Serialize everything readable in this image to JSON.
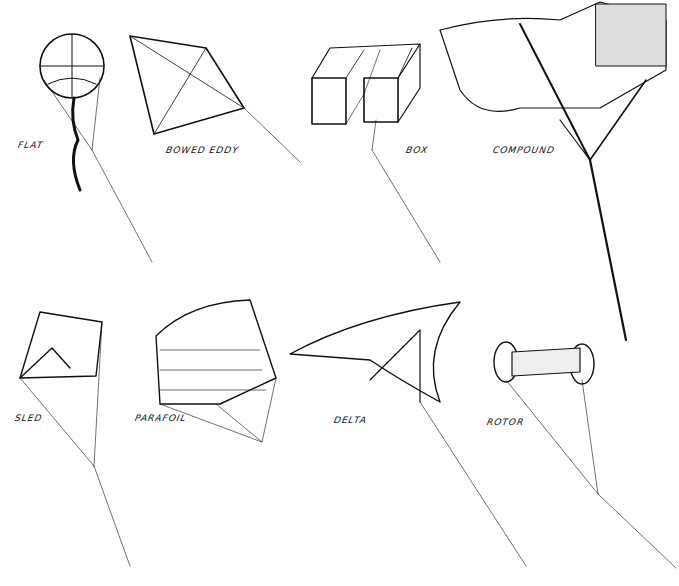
{
  "kites": [
    {
      "id": "flat",
      "label": "FLAT",
      "x": 18,
      "y": 140
    },
    {
      "id": "bowed-eddy",
      "label": "BOWED EDDY",
      "x": 166,
      "y": 145
    },
    {
      "id": "box",
      "label": "BOX",
      "x": 406,
      "y": 145
    },
    {
      "id": "compound",
      "label": "COMPOUND",
      "x": 493,
      "y": 145
    },
    {
      "id": "sled",
      "label": "SLED",
      "x": 15,
      "y": 413
    },
    {
      "id": "parafoil",
      "label": "PARAFOIL",
      "x": 135,
      "y": 413
    },
    {
      "id": "delta",
      "label": "DELTA",
      "x": 334,
      "y": 415
    },
    {
      "id": "rotor",
      "label": "ROTOR",
      "x": 487,
      "y": 417
    }
  ]
}
